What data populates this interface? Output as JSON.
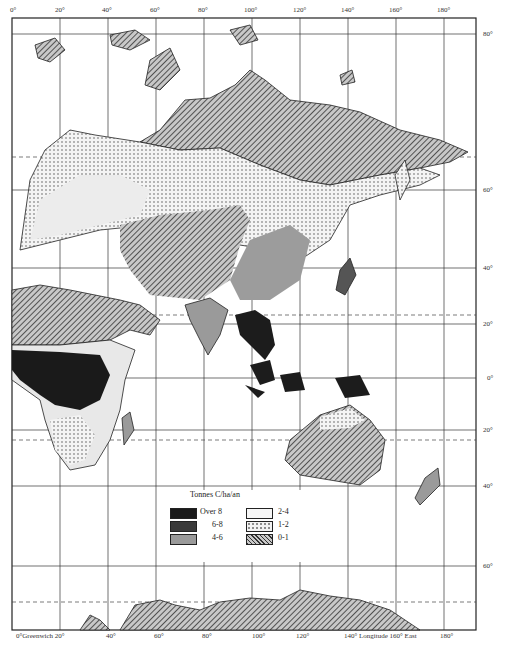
{
  "map": {
    "title": "Tonnes C/ha/an",
    "top_longitude_labels": [
      "0°",
      "20°",
      "40°",
      "60°",
      "80°",
      "100°",
      "120°",
      "140°",
      "160°",
      "180°"
    ],
    "bottom_longitude_labels": [
      "0°Greenwich 20°",
      "40°",
      "60°",
      "80°",
      "100°",
      "120°",
      "140° Longitude 160° East",
      "180°"
    ],
    "right_latitude_labels": [
      "80°",
      "60°",
      "40°",
      "20°",
      "0°",
      "20°",
      "40°",
      "60°"
    ],
    "legend": {
      "title": "Tonnes C/ha/an",
      "items": [
        {
          "label": "Over 8",
          "fill": "#1a1a1a",
          "pattern": "solid-black"
        },
        {
          "label": "6-8",
          "fill": "#3a3a3a",
          "pattern": "dark-grey"
        },
        {
          "label": "4-6",
          "fill": "#9a9a9a",
          "pattern": "medium-grey"
        },
        {
          "label": "2-4",
          "fill": "#f2f2f2",
          "pattern": "light"
        },
        {
          "label": "1-2",
          "fill": "#e6e6e6",
          "pattern": "dotted"
        },
        {
          "label": "0-1",
          "fill": "#8a8a8a",
          "pattern": "hatched"
        }
      ]
    }
  }
}
